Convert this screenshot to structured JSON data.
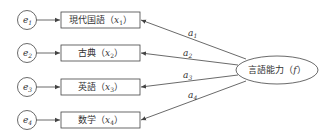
{
  "diagram": {
    "type": "factor-analysis-path-diagram",
    "errors": [
      {
        "label": "e",
        "sub": "1"
      },
      {
        "label": "e",
        "sub": "2"
      },
      {
        "label": "e",
        "sub": "3"
      },
      {
        "label": "e",
        "sub": "4"
      }
    ],
    "observed": [
      {
        "name": "現代国語",
        "var": "x",
        "sub": "1"
      },
      {
        "name": "古典",
        "var": "x",
        "sub": "2"
      },
      {
        "name": "英語",
        "var": "x",
        "sub": "3"
      },
      {
        "name": "数学",
        "var": "x",
        "sub": "4"
      }
    ],
    "loadings": [
      {
        "label": "a",
        "sub": "1"
      },
      {
        "label": "a",
        "sub": "2"
      },
      {
        "label": "a",
        "sub": "3"
      },
      {
        "label": "a",
        "sub": "4"
      }
    ],
    "factor": {
      "name": "言語能力",
      "var": "f"
    },
    "paren_open": "（",
    "paren_close": "）",
    "colors": {
      "stroke": "#444444",
      "text": "#333333",
      "background": "#ffffff"
    }
  }
}
